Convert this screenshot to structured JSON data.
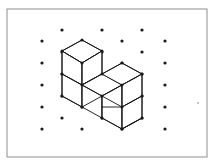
{
  "figure": {
    "canvas": {
      "width": 218,
      "height": 166
    },
    "colors": {
      "background": "#ffffff",
      "frame_stroke": "#8e8e8e",
      "line_stroke": "#111111",
      "dot_fill": "#1a1a1a",
      "face_fill": "#ffffff",
      "stray_mark": "#b8b8b8"
    },
    "frame": {
      "x": 7,
      "y": 9,
      "width": 200,
      "height": 148
    },
    "lattice": {
      "dot_radius": 1.6,
      "spacing_x": 20,
      "spacing_y": 11,
      "points": [
        [
          62,
          30
        ],
        [
          102,
          30
        ],
        [
          142,
          30
        ],
        [
          42,
          41
        ],
        [
          82,
          41
        ],
        [
          122,
          41
        ],
        [
          165,
          41
        ],
        [
          62,
          52
        ],
        [
          102,
          52
        ],
        [
          142,
          52
        ],
        [
          42,
          63
        ],
        [
          82,
          63
        ],
        [
          122,
          63
        ],
        [
          165,
          63
        ],
        [
          62,
          74
        ],
        [
          102,
          74
        ],
        [
          142,
          74
        ],
        [
          42,
          85
        ],
        [
          82,
          85
        ],
        [
          122,
          85
        ],
        [
          165,
          85
        ],
        [
          62,
          96
        ],
        [
          102,
          96
        ],
        [
          142,
          96
        ],
        [
          42,
          107
        ],
        [
          82,
          107
        ],
        [
          122,
          107
        ],
        [
          165,
          107
        ],
        [
          62,
          118
        ],
        [
          102,
          118
        ],
        [
          142,
          118
        ],
        [
          42,
          129
        ],
        [
          82,
          129
        ],
        [
          122,
          129
        ],
        [
          165,
          129
        ]
      ]
    },
    "cubes": {
      "count": 4,
      "arrangement": "L-shape: three cubes in a row along the right-down axis, one cube stacked on top of the leftmost",
      "faces": [
        {
          "name": "upper-cube-top-face",
          "points": "62,51 82,40 102,51 82,63"
        },
        {
          "name": "upper-cube-left-face",
          "points": "62,51 82,63 82,85 62,74"
        },
        {
          "name": "upper-cube-right-face",
          "points": "82,63 102,51 102,74 82,85"
        },
        {
          "name": "lower-left-cube-left-face",
          "points": "62,74 82,85 82,107 62,96"
        },
        {
          "name": "lower-left-cube-right-face",
          "points": "82,85 102,74 102,96 82,107"
        },
        {
          "name": "middle-cube-top-face",
          "points": "82,85 102,74 122,85 102,96"
        },
        {
          "name": "middle-cube-right-face",
          "points": "102,96 122,85 122,107 102,118"
        },
        {
          "name": "right-cube-top-face",
          "points": "102,74 122,63 142,74 122,85"
        },
        {
          "name": "right-cube-left-face",
          "points": "122,85 142,74 142,96 122,107"
        },
        {
          "name": "right-cube-front-face",
          "points": "102,96 122,107 122,129 102,118"
        },
        {
          "name": "right-cube-side-face",
          "points": "122,107 142,96 142,118 122,129"
        }
      ],
      "edges": [
        {
          "name": "upper-cube-vertical-center",
          "x1": 82,
          "y1": 63,
          "x2": 82,
          "y2": 107
        },
        {
          "name": "upper-cube-vertical-left",
          "x1": 62,
          "y1": 51,
          "x2": 62,
          "y2": 96
        },
        {
          "name": "upper-cube-vertical-right",
          "x1": 102,
          "y1": 51,
          "x2": 102,
          "y2": 74
        },
        {
          "name": "middle-cube-vertical",
          "x1": 102,
          "y1": 96,
          "x2": 102,
          "y2": 118
        },
        {
          "name": "right-cube-vertical-center",
          "x1": 122,
          "y1": 85,
          "x2": 122,
          "y2": 129
        },
        {
          "name": "right-cube-vertical-right",
          "x1": 142,
          "y1": 74,
          "x2": 142,
          "y2": 118
        },
        {
          "name": "baseline-left",
          "x1": 62,
          "y1": 96,
          "x2": 82,
          "y2": 107
        },
        {
          "name": "baseline-middle",
          "x1": 82,
          "y1": 107,
          "x2": 102,
          "y2": 118
        },
        {
          "name": "baseline-right",
          "x1": 102,
          "y1": 118,
          "x2": 122,
          "y2": 129
        },
        {
          "name": "baseline-far-right",
          "x1": 122,
          "y1": 129,
          "x2": 142,
          "y2": 118
        },
        {
          "name": "midline-left",
          "x1": 62,
          "y1": 74,
          "x2": 82,
          "y2": 85
        },
        {
          "name": "midline-right",
          "x1": 82,
          "y1": 85,
          "x2": 102,
          "y2": 96
        },
        {
          "name": "top-ridge-left",
          "x1": 62,
          "y1": 51,
          "x2": 82,
          "y2": 40
        },
        {
          "name": "top-ridge-right",
          "x1": 82,
          "y1": 40,
          "x2": 102,
          "y2": 51
        },
        {
          "name": "top-front-left",
          "x1": 62,
          "y1": 51,
          "x2": 82,
          "y2": 63
        },
        {
          "name": "top-front-right",
          "x1": 82,
          "y1": 63,
          "x2": 102,
          "y2": 51
        },
        {
          "name": "step-ridge-left",
          "x1": 102,
          "y1": 74,
          "x2": 122,
          "y2": 63
        },
        {
          "name": "step-ridge-right",
          "x1": 122,
          "y1": 63,
          "x2": 142,
          "y2": 74
        },
        {
          "name": "step-front-left",
          "x1": 102,
          "y1": 96,
          "x2": 122,
          "y2": 85
        },
        {
          "name": "step-front-right",
          "x1": 122,
          "y1": 85,
          "x2": 142,
          "y2": 74
        },
        {
          "name": "step-inner-left",
          "x1": 82,
          "y1": 85,
          "x2": 102,
          "y2": 74
        },
        {
          "name": "step-inner-right",
          "x1": 102,
          "y1": 107,
          "x2": 122,
          "y2": 107
        },
        {
          "name": "right-cube-back-edge",
          "x1": 142,
          "y1": 96,
          "x2": 122,
          "y2": 107
        },
        {
          "name": "right-cube-lower-edge",
          "x1": 142,
          "y1": 118,
          "x2": 122,
          "y2": 129
        }
      ],
      "vertices": [
        [
          82,
          40
        ],
        [
          62,
          51
        ],
        [
          102,
          51
        ],
        [
          82,
          63
        ],
        [
          62,
          74
        ],
        [
          102,
          74
        ],
        [
          82,
          85
        ],
        [
          122,
          85
        ],
        [
          122,
          63
        ],
        [
          142,
          74
        ],
        [
          62,
          96
        ],
        [
          102,
          96
        ],
        [
          82,
          107
        ],
        [
          142,
          96
        ],
        [
          122,
          107
        ],
        [
          102,
          118
        ],
        [
          142,
          118
        ],
        [
          122,
          129
        ]
      ]
    },
    "stray_marks": [
      {
        "name": "speck-right-margin",
        "x": 198,
        "y": 103,
        "r": 1.1
      }
    ]
  }
}
